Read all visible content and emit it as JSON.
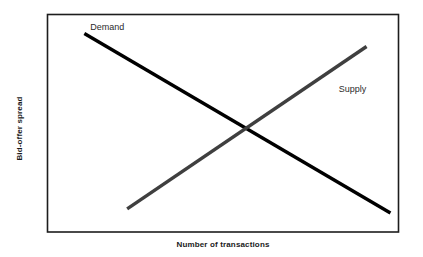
{
  "chart_data": {
    "type": "line",
    "title": "",
    "subtitle": "",
    "xlabel": "Number of transactions",
    "ylabel": "Bid-offer spread",
    "xlim": [
      0,
      100
    ],
    "ylim": [
      0,
      100
    ],
    "grid": false,
    "legend_position": "inline-annotations",
    "axis_ticks": {
      "x": [],
      "y": []
    },
    "series": [
      {
        "name": "Demand",
        "label": "Demand",
        "color": "#000000",
        "line_width": 3,
        "x": [
          10.5,
          97.7
        ],
        "y": [
          91.3,
          8.7
        ],
        "description": "downward sloping demand curve"
      },
      {
        "name": "Supply",
        "label": "Supply",
        "color": "#3f3f3f",
        "line_width": 3,
        "x": [
          22.7,
          90.9
        ],
        "y": [
          10.6,
          85.3
        ],
        "description": "upward sloping supply curve"
      }
    ],
    "annotations": [
      {
        "text": "Demand",
        "x": 11.6,
        "y": 94.0
      },
      {
        "text": "Supply",
        "x": 82.4,
        "y": 65.1
      }
    ],
    "intersection": {
      "x": 56.3,
      "y": 47.7
    }
  },
  "colors": {
    "background": "#ffffff",
    "plot_border": "#1d1d1d",
    "demand_line": "#000000",
    "supply_line": "#3f3f3f",
    "axis_title": "#1a1a1a",
    "series_label": "#2b2b2b"
  }
}
